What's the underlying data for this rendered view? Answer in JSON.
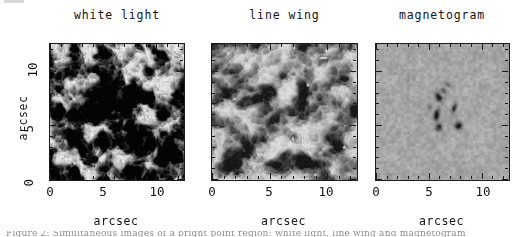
{
  "figure": {
    "type": "image-panels",
    "panels": [
      {
        "title": "white light",
        "xlabel": "arcsec",
        "ylabel": "arcsec",
        "xticks": [
          "0",
          "5",
          "10"
        ],
        "yticks": [
          "0",
          "5",
          "10"
        ],
        "xlim": [
          0,
          12.5
        ],
        "ylim": [
          0,
          12.5
        ],
        "image_kind": "granulation",
        "contrast": "high",
        "description": "solar granulation in white light, strong contrast, dark intergranular lanes"
      },
      {
        "title": "line wing",
        "xlabel": "arcsec",
        "ylabel": "",
        "xticks": [
          "0",
          "5",
          "10"
        ],
        "yticks": [
          "0",
          "5",
          "10"
        ],
        "xlim": [
          0,
          12.5
        ],
        "ylim": [
          0,
          12.5
        ],
        "image_kind": "granulation-lowcontrast",
        "contrast": "medium",
        "description": "line wing image, smeared granulation with bright points along lanes"
      },
      {
        "title": "magnetogram",
        "xlabel": "arcsec",
        "ylabel": "",
        "xticks": [
          "0",
          "5",
          "10"
        ],
        "yticks": [
          "0",
          "5",
          "10"
        ],
        "xlim": [
          0,
          12.5
        ],
        "ylim": [
          0,
          12.5
        ],
        "image_kind": "magnetogram",
        "contrast": "low",
        "description": "magnetogram, flat grey noise with a compact dark magnetic element near centre"
      }
    ],
    "colors": {
      "axis": "#1c1c1c",
      "text": "#141414",
      "background": "#ffffff",
      "image_mid_grey": "#808080"
    },
    "caption_partial": "Figure 2: Simultaneous images of a bright point region: white light, line wing and magnetogram"
  },
  "chart_data": {
    "type": "heatmap",
    "title": "",
    "panel_titles": [
      "white light",
      "line wing",
      "magnetogram"
    ],
    "xlabel": "arcsec",
    "ylabel": "arcsec",
    "xlim": [
      0,
      12.5
    ],
    "ylim": [
      0,
      12.5
    ],
    "xticks": [
      0,
      5,
      10
    ],
    "yticks": [
      0,
      5,
      10
    ],
    "minor_tick_interval": 1,
    "grid": false,
    "legend": "none",
    "colormap": "greyscale",
    "series": [
      {
        "name": "white light",
        "mean_level": 0.5,
        "rms_contrast": 0.22,
        "granule_scale_arcsec": 1.3,
        "feature": "granulation"
      },
      {
        "name": "line wing",
        "mean_level": 0.52,
        "rms_contrast": 0.13,
        "granule_scale_arcsec": 1.6,
        "feature": "granulation with bright points"
      },
      {
        "name": "magnetogram",
        "mean_level": 0.62,
        "rms_contrast": 0.035,
        "granule_scale_arcsec": 0.35,
        "feature": "dark magnetic element at (6.3, 6.0) arcsec"
      }
    ]
  }
}
